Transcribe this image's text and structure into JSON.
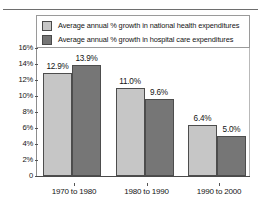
{
  "chart_data": {
    "type": "bar",
    "title": "",
    "xlabel": "",
    "ylabel": "",
    "categories": [
      "1970 to 1980",
      "1980 to 1990",
      "1990 to 2000"
    ],
    "series": [
      {
        "name": "Average annual % growth in national health expenditures",
        "color": "#c6c6c6",
        "values": [
          12.9,
          11.0,
          6.4
        ],
        "labels": [
          "12.9%",
          "11.0%",
          "6.4%"
        ]
      },
      {
        "name": "Average annual % growth in hospital care expenditures",
        "color": "#767676",
        "values": [
          13.9,
          9.6,
          5.0
        ],
        "labels": [
          "13.9%",
          "9.6%",
          "5.0%"
        ]
      }
    ],
    "ylim": [
      0,
      16
    ],
    "y_ticks": [
      0,
      2,
      4,
      6,
      8,
      10,
      12,
      14,
      16
    ],
    "y_tick_labels": [
      "0",
      "2%",
      "4%",
      "6%",
      "8%",
      "10%",
      "12%",
      "14%",
      "16%"
    ],
    "grid": false,
    "legend_position": "top-inside"
  },
  "legend": {
    "items": [
      {
        "label": "Average annual % growth in national health expenditures",
        "swatch": "light"
      },
      {
        "label": "Average annual % growth in hospital care expenditures",
        "swatch": "dark"
      }
    ]
  }
}
